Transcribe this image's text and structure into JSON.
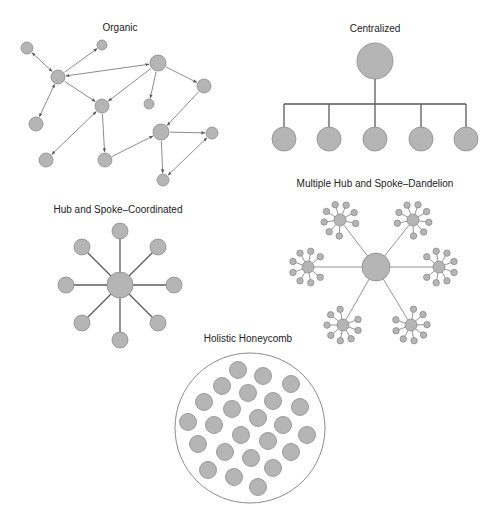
{
  "colors": {
    "node_fill": "#b5b5b5",
    "node_stroke": "#8c8c8c",
    "edge_dark": "#5a5a5a",
    "edge_light": "#8a8a8a",
    "text": "#222222",
    "background": "#ffffff"
  },
  "diagrams": {
    "organic": {
      "title": "Organic",
      "title_pos": [
        120,
        31
      ],
      "nodes": [
        {
          "id": "A",
          "x": 27,
          "y": 48,
          "r": 6
        },
        {
          "id": "B",
          "x": 102,
          "y": 45,
          "r": 5
        },
        {
          "id": "C",
          "x": 58,
          "y": 77,
          "r": 7
        },
        {
          "id": "D",
          "x": 102,
          "y": 106,
          "r": 7
        },
        {
          "id": "E",
          "x": 36,
          "y": 124,
          "r": 7
        },
        {
          "id": "F",
          "x": 46,
          "y": 160,
          "r": 7
        },
        {
          "id": "G",
          "x": 105,
          "y": 160,
          "r": 7
        },
        {
          "id": "H",
          "x": 158,
          "y": 63,
          "r": 8
        },
        {
          "id": "I",
          "x": 149,
          "y": 104,
          "r": 5
        },
        {
          "id": "J",
          "x": 204,
          "y": 86,
          "r": 7
        },
        {
          "id": "K",
          "x": 161,
          "y": 132,
          "r": 8
        },
        {
          "id": "L",
          "x": 212,
          "y": 133,
          "r": 6
        },
        {
          "id": "M",
          "x": 163,
          "y": 180,
          "r": 6
        }
      ],
      "edges": [
        {
          "from": "C",
          "to": "A",
          "bidirectional": true
        },
        {
          "from": "C",
          "to": "B",
          "bidirectional": false
        },
        {
          "from": "C",
          "to": "H",
          "bidirectional": true
        },
        {
          "from": "C",
          "to": "D",
          "bidirectional": false
        },
        {
          "from": "C",
          "to": "E",
          "bidirectional": true
        },
        {
          "from": "H",
          "to": "D",
          "bidirectional": false
        },
        {
          "from": "H",
          "to": "I",
          "bidirectional": false
        },
        {
          "from": "H",
          "to": "J",
          "bidirectional": false
        },
        {
          "from": "D",
          "to": "F",
          "bidirectional": true
        },
        {
          "from": "D",
          "to": "G",
          "bidirectional": false
        },
        {
          "from": "J",
          "to": "K",
          "bidirectional": false
        },
        {
          "from": "G",
          "to": "K",
          "bidirectional": false
        },
        {
          "from": "K",
          "to": "L",
          "bidirectional": false
        },
        {
          "from": "K",
          "to": "M",
          "bidirectional": false
        },
        {
          "from": "L",
          "to": "M",
          "bidirectional": true
        }
      ]
    },
    "centralized": {
      "title": "Centralized",
      "title_pos": [
        375,
        32
      ],
      "root": {
        "x": 375,
        "y": 61,
        "r": 18
      },
      "bar_y": 104,
      "children": [
        {
          "x": 284,
          "y": 139,
          "r": 12
        },
        {
          "x": 329,
          "y": 139,
          "r": 12
        },
        {
          "x": 375,
          "y": 139,
          "r": 12
        },
        {
          "x": 421,
          "y": 139,
          "r": 12
        },
        {
          "x": 466,
          "y": 139,
          "r": 12
        }
      ]
    },
    "hub_and_spoke": {
      "title": "Hub and Spoke–Coordinated",
      "title_pos": [
        118,
        213
      ],
      "hub": {
        "x": 120,
        "y": 285,
        "r": 13
      },
      "spokes": [
        {
          "x": 120,
          "y": 231,
          "r": 8
        },
        {
          "x": 158,
          "y": 247,
          "r": 8
        },
        {
          "x": 174,
          "y": 285,
          "r": 8
        },
        {
          "x": 158,
          "y": 323,
          "r": 8
        },
        {
          "x": 120,
          "y": 340,
          "r": 8
        },
        {
          "x": 82,
          "y": 323,
          "r": 8
        },
        {
          "x": 66,
          "y": 285,
          "r": 8
        },
        {
          "x": 82,
          "y": 247,
          "r": 8
        }
      ]
    },
    "dandelion": {
      "title": "Multiple Hub and Spoke–Dandelion",
      "title_pos": [
        375,
        187
      ],
      "hub": {
        "x": 376,
        "y": 267,
        "r": 14
      },
      "sub_hubs": [
        {
          "x": 340,
          "y": 220,
          "r": 6
        },
        {
          "x": 413,
          "y": 220,
          "r": 6
        },
        {
          "x": 439,
          "y": 267,
          "r": 6
        },
        {
          "x": 411,
          "y": 325,
          "r": 6
        },
        {
          "x": 343,
          "y": 325,
          "r": 6
        },
        {
          "x": 308,
          "y": 267,
          "r": 6
        }
      ],
      "satellite_count": 8,
      "satellite_distance": 16,
      "satellite_r": 3.2
    },
    "honeycomb": {
      "title": "Holistic Honeycomb",
      "title_pos": [
        248,
        342
      ],
      "boundary": {
        "x": 250,
        "y": 428,
        "r": 75
      },
      "cell_r": 8.5,
      "cells": [
        [
          238,
          370
        ],
        [
          263,
          376
        ],
        [
          291,
          384
        ],
        [
          222,
          386
        ],
        [
          248,
          393
        ],
        [
          273,
          401
        ],
        [
          300,
          407
        ],
        [
          204,
          402
        ],
        [
          232,
          409
        ],
        [
          258,
          418
        ],
        [
          283,
          425
        ],
        [
          307,
          435
        ],
        [
          188,
          422
        ],
        [
          214,
          425
        ],
        [
          241,
          435
        ],
        [
          268,
          441
        ],
        [
          291,
          452
        ],
        [
          198,
          444
        ],
        [
          225,
          452
        ],
        [
          251,
          458
        ],
        [
          273,
          468
        ],
        [
          208,
          470
        ],
        [
          234,
          477
        ],
        [
          258,
          487
        ]
      ]
    }
  }
}
